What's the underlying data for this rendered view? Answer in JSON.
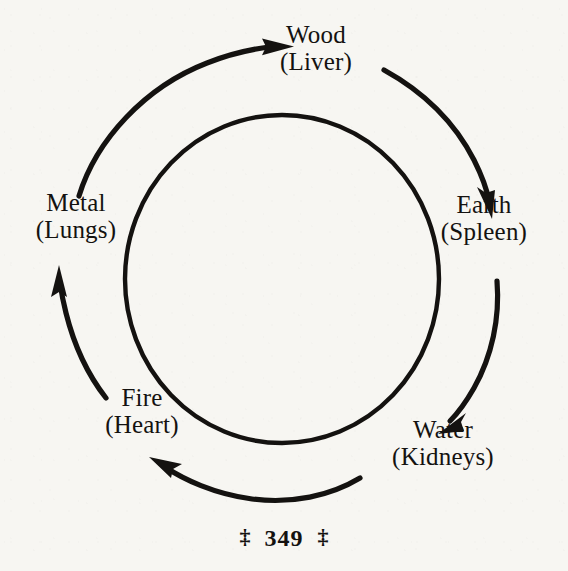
{
  "page": {
    "background_color": "#f7f6f2",
    "ink_color": "#141210"
  },
  "diagram": {
    "type": "cycle",
    "nodes": [
      {
        "id": "wood",
        "element": "Wood",
        "organ": "(Liver)",
        "position": "top"
      },
      {
        "id": "earth",
        "element": "Earth",
        "organ": "(Spleen)",
        "position": "right"
      },
      {
        "id": "water",
        "element": "Water",
        "organ": "(Kidneys)",
        "position": "bottom-right"
      },
      {
        "id": "fire",
        "element": "Fire",
        "organ": "(Heart)",
        "position": "bottom-left"
      },
      {
        "id": "metal",
        "element": "Metal",
        "organ": "(Lungs)",
        "position": "left"
      }
    ],
    "arrows": [
      {
        "from": "metal",
        "to": "wood"
      },
      {
        "from": "wood",
        "to": "earth"
      },
      {
        "from": "earth",
        "to": "water"
      },
      {
        "from": "water",
        "to": "fire"
      },
      {
        "from": "fire",
        "to": "metal"
      }
    ],
    "inner_circle": {
      "cx": 282,
      "cy": 279,
      "r": 162
    }
  },
  "footer": {
    "ornament_left": "‡",
    "page_number": "349",
    "ornament_right": "‡"
  }
}
